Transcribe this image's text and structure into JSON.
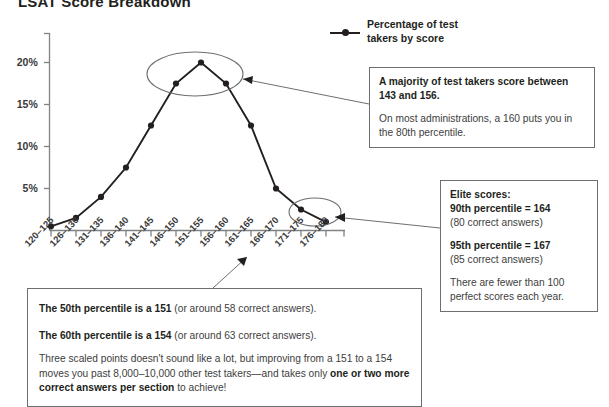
{
  "title": "LSAT Score Breakdown",
  "legend": {
    "label": "Percentage of test takers by score",
    "marker": "line-dot-marker"
  },
  "chart_data": {
    "type": "line",
    "title": "LSAT Score Breakdown",
    "xlabel": "",
    "ylabel": "",
    "categories": [
      "120–125",
      "126–130",
      "131–135",
      "136–140",
      "141–145",
      "146–150",
      "151–155",
      "156–160",
      "161–165",
      "166–170",
      "171–175",
      "176–180"
    ],
    "values": [
      0.5,
      1.5,
      4.0,
      7.5,
      12.5,
      17.5,
      20.0,
      17.5,
      12.5,
      5.0,
      2.5,
      1.0
    ],
    "series": [
      {
        "name": "Percentage of test takers by score",
        "values": [
          0.5,
          1.5,
          4.0,
          7.5,
          12.5,
          17.5,
          20.0,
          17.5,
          12.5,
          5.0,
          2.5,
          1.0
        ]
      }
    ],
    "ytick_labels": [
      "20%",
      "15%",
      "10%",
      "5%"
    ],
    "ytick_values": [
      20,
      15,
      10,
      5
    ],
    "ylim": [
      0,
      22
    ],
    "grid": false,
    "legend_position": "top-right",
    "annotations": [
      {
        "name": "peak-highlight-ellipse",
        "shape": "ellipse",
        "covers": [
          "146–150",
          "151–155",
          "156–160"
        ]
      },
      {
        "name": "elite-highlight-ellipse",
        "shape": "ellipse",
        "covers": [
          "171–175",
          "176–180"
        ]
      }
    ]
  },
  "callouts": {
    "majority": {
      "heading": "A majority of test takers score between 143 and 156.",
      "body": "On most administrations, a 160 puts you in the 80th percentile."
    },
    "elite": {
      "heading": "Elite scores:",
      "line1_bold": "90th percentile = 164",
      "line1_sub": "(80 correct answers)",
      "line2_bold": "95th percentile = 167",
      "line2_sub": "(85 correct answers)",
      "body": "There are fewer than 100 perfect scores each year."
    },
    "percentiles": {
      "line1_bold": "The 50th percentile is a 151",
      "line1_rest": " (or around 58 correct answers).",
      "line2_bold": "The 60th percentile is a 154",
      "line2_rest": " (or around 63 correct answers).",
      "para_a": "Three scaled points doesn't sound like a lot, but improving from a 151 to a 154 moves you past 8,000–10,000 other test takers—and takes only ",
      "para_bold": "one or two more correct answers per section",
      "para_b": " to achieve!"
    }
  },
  "colors": {
    "ink": "#231f20",
    "axis": "#808285",
    "box_border": "#6d6e71",
    "body_text": "#404040"
  }
}
